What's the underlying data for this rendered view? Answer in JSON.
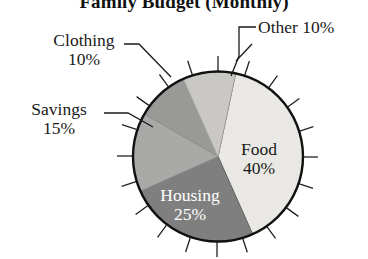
{
  "chart_data": {
    "type": "pie",
    "title": "Family Budget (Monthly)",
    "xlabel": "",
    "ylabel": "",
    "legend_position": "none",
    "grid": false,
    "categories": [
      "Food",
      "Housing",
      "Savings",
      "Clothing",
      "Other"
    ],
    "values": [
      40,
      25,
      15,
      10,
      10
    ],
    "unit": "%",
    "start_angle_deg": 12,
    "direction": "clockwise",
    "slices": [
      {
        "label": "Food",
        "value": 40,
        "value_text": "40%",
        "color": "#e9e8e4",
        "label_placement": "inside",
        "text_color": "#1a1a1a"
      },
      {
        "label": "Housing",
        "value": 25,
        "value_text": "25%",
        "color": "#7f7f7f",
        "label_placement": "inside",
        "text_color": "#ffffff"
      },
      {
        "label": "Savings",
        "value": 15,
        "value_text": "15%",
        "color": "#a9a9a7",
        "label_placement": "callout",
        "text_color": "#1a1a1a"
      },
      {
        "label": "Clothing",
        "value": 10,
        "value_text": "10%",
        "color": "#999997",
        "label_placement": "callout",
        "text_color": "#1a1a1a"
      },
      {
        "label": "Other",
        "value": 10,
        "value_text": "10%",
        "color": "#c9c8c5",
        "label_placement": "callout",
        "text_color": "#1a1a1a"
      }
    ],
    "tick_marks": true,
    "tick_count": 20,
    "outline_color": "#111111"
  },
  "title": {
    "text": "Family Budget (Monthly)"
  },
  "callouts": {
    "clothing": {
      "name": "Clothing",
      "percent": "10%"
    },
    "savings": {
      "name": "Savings",
      "percent": "15%"
    },
    "other": {
      "text": "Other 10%"
    }
  },
  "inner_labels": {
    "food": {
      "name": "Food",
      "percent": "40%"
    },
    "housing": {
      "name": "Housing",
      "percent": "25%"
    }
  }
}
